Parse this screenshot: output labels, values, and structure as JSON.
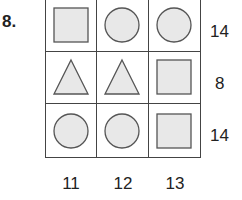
{
  "question": {
    "number_label": "8."
  },
  "colors": {
    "fill": "#e8e8e8",
    "stroke": "#555555"
  },
  "grid": {
    "rows": [
      [
        "square-icon",
        "circle-icon",
        "circle-icon"
      ],
      [
        "triangle-icon",
        "triangle-icon",
        "square-icon"
      ],
      [
        "circle-icon",
        "circle-icon",
        "square-icon"
      ]
    ]
  },
  "row_sums": [
    "14",
    "8",
    "14"
  ],
  "column_sums": [
    "11",
    "12",
    "13"
  ]
}
